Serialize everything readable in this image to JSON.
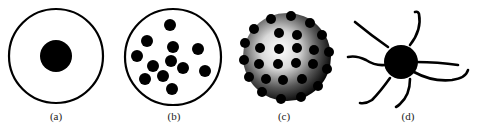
{
  "figure": {
    "panels": [
      {
        "id": "a",
        "label": "(a)",
        "description": "single core in a shell",
        "label_x": 56
      },
      {
        "id": "b",
        "label": "(b)",
        "description": "multiple dispersed particles in a shell",
        "label_x": 174
      },
      {
        "id": "c",
        "label": "(c)",
        "description": "shaded sphere decorated with particles",
        "label_x": 284
      },
      {
        "id": "d",
        "label": "(d)",
        "description": "core with tentacle-like arms",
        "label_x": 408
      }
    ],
    "colors": {
      "ink": "#000000",
      "background": "#ffffff",
      "highlight": "#ffffff"
    }
  }
}
